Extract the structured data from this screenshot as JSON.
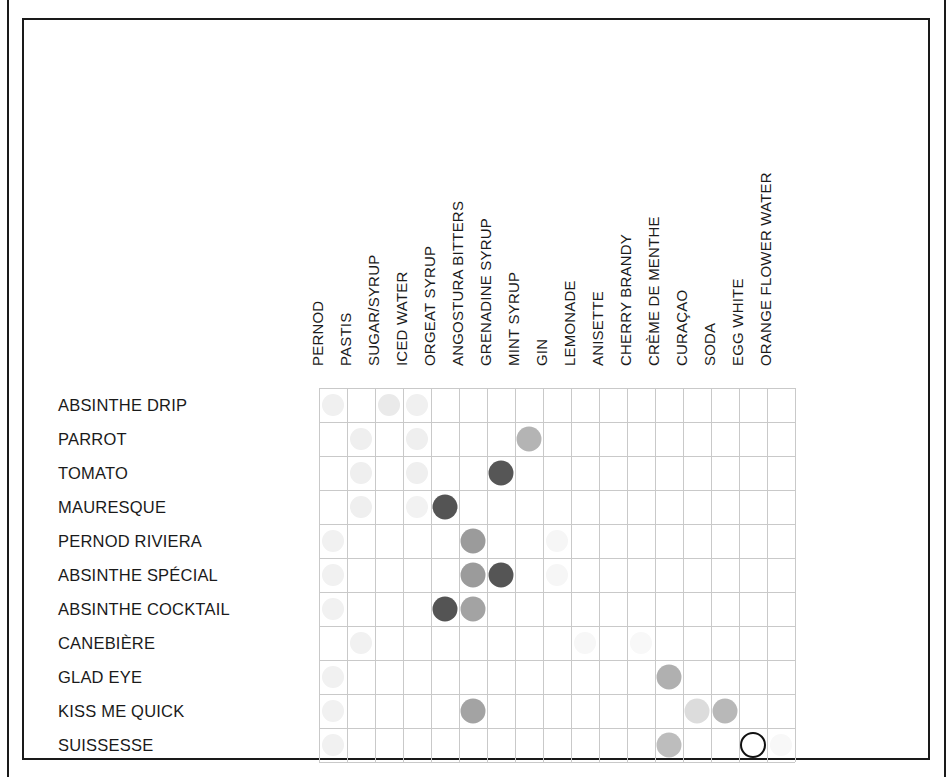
{
  "figure": {
    "title": "",
    "frame_color": "#1a1a1a",
    "grid_color": "#c9c9c9"
  },
  "chart_data": {
    "type": "heatmap",
    "title": "",
    "xlabel": "",
    "ylabel": "",
    "grid": true,
    "legend": "none",
    "categories": [
      "PERNOD",
      "PASTIS",
      "SUGAR/SYRUP",
      "ICED WATER",
      "ORGEAT SYRUP",
      "ANGOSTURA BITTERS",
      "GRENADINE SYRUP",
      "MINT SYRUP",
      "GIN",
      "LEMONADE",
      "ANISETTE",
      "CHERRY BRANDY",
      "CRÈME DE MENTHE",
      "CURAÇAO",
      "SODA",
      "EGG WHITE",
      "ORANGE FLOWER WATER"
    ],
    "rows": [
      "ABSINTHE DRIP",
      "PARROT",
      "TOMATO",
      "MAURESQUE",
      "PERNOD RIVIERA",
      "ABSINTHE SPÉCIAL",
      "ABSINTHE COCKTAIL",
      "CANEBIÈRE",
      "GLAD EYE",
      "KISS ME QUICK",
      "SUISSESSE"
    ],
    "points": [
      {
        "row": "ABSINTHE DRIP",
        "col": "PERNOD",
        "r": 0,
        "c": 0,
        "shade": "#f0f0f0",
        "size": 22,
        "style": "filled"
      },
      {
        "row": "ABSINTHE DRIP",
        "col": "SUGAR/SYRUP",
        "r": 0,
        "c": 2,
        "shade": "#eaeaea",
        "size": 22,
        "style": "filled"
      },
      {
        "row": "ABSINTHE DRIP",
        "col": "ICED WATER",
        "r": 0,
        "c": 3,
        "shade": "#f0f0f0",
        "size": 22,
        "style": "filled"
      },
      {
        "row": "PARROT",
        "col": "PASTIS",
        "r": 1,
        "c": 1,
        "shade": "#efefef",
        "size": 22,
        "style": "filled"
      },
      {
        "row": "PARROT",
        "col": "ICED WATER",
        "r": 1,
        "c": 3,
        "shade": "#efefef",
        "size": 22,
        "style": "filled"
      },
      {
        "row": "PARROT",
        "col": "MINT SYRUP",
        "r": 1,
        "c": 7,
        "shade": "#b4b4b4",
        "size": 25,
        "style": "filled"
      },
      {
        "row": "TOMATO",
        "col": "PASTIS",
        "r": 2,
        "c": 1,
        "shade": "#efefef",
        "size": 22,
        "style": "filled"
      },
      {
        "row": "TOMATO",
        "col": "ICED WATER",
        "r": 2,
        "c": 3,
        "shade": "#efefef",
        "size": 22,
        "style": "filled"
      },
      {
        "row": "TOMATO",
        "col": "GRENADINE SYRUP",
        "r": 2,
        "c": 6,
        "shade": "#565656",
        "size": 25,
        "style": "filled"
      },
      {
        "row": "MAURESQUE",
        "col": "PASTIS",
        "r": 3,
        "c": 1,
        "shade": "#efefef",
        "size": 22,
        "style": "filled"
      },
      {
        "row": "MAURESQUE",
        "col": "ICED WATER",
        "r": 3,
        "c": 3,
        "shade": "#f2f2f2",
        "size": 22,
        "style": "filled"
      },
      {
        "row": "MAURESQUE",
        "col": "ORGEAT SYRUP",
        "r": 3,
        "c": 4,
        "shade": "#545454",
        "size": 25,
        "style": "filled"
      },
      {
        "row": "PERNOD RIVIERA",
        "col": "PERNOD",
        "r": 4,
        "c": 0,
        "shade": "#f1f1f1",
        "size": 22,
        "style": "filled"
      },
      {
        "row": "PERNOD RIVIERA",
        "col": "ANGOSTURA BITTERS",
        "r": 4,
        "c": 5,
        "shade": "#9b9b9b",
        "size": 25,
        "style": "filled"
      },
      {
        "row": "PERNOD RIVIERA",
        "col": "GIN",
        "r": 4,
        "c": 8,
        "shade": "#f6f6f6",
        "size": 22,
        "style": "filled"
      },
      {
        "row": "ABSINTHE SPÉCIAL",
        "col": "PERNOD",
        "r": 5,
        "c": 0,
        "shade": "#f1f1f1",
        "size": 22,
        "style": "filled"
      },
      {
        "row": "ABSINTHE SPÉCIAL",
        "col": "ANGOSTURA BITTERS",
        "r": 5,
        "c": 5,
        "shade": "#9b9b9b",
        "size": 25,
        "style": "filled"
      },
      {
        "row": "ABSINTHE SPÉCIAL",
        "col": "GRENADINE SYRUP",
        "r": 5,
        "c": 6,
        "shade": "#555555",
        "size": 25,
        "style": "filled"
      },
      {
        "row": "ABSINTHE SPÉCIAL",
        "col": "GIN",
        "r": 5,
        "c": 8,
        "shade": "#f6f6f6",
        "size": 22,
        "style": "filled"
      },
      {
        "row": "ABSINTHE COCKTAIL",
        "col": "PERNOD",
        "r": 6,
        "c": 0,
        "shade": "#f1f1f1",
        "size": 22,
        "style": "filled"
      },
      {
        "row": "ABSINTHE COCKTAIL",
        "col": "ORGEAT SYRUP",
        "r": 6,
        "c": 4,
        "shade": "#545454",
        "size": 25,
        "style": "filled"
      },
      {
        "row": "ABSINTHE COCKTAIL",
        "col": "ANGOSTURA BITTERS",
        "r": 6,
        "c": 5,
        "shade": "#a3a3a3",
        "size": 25,
        "style": "filled"
      },
      {
        "row": "CANEBIÈRE",
        "col": "PASTIS",
        "r": 7,
        "c": 1,
        "shade": "#f1f1f1",
        "size": 22,
        "style": "filled"
      },
      {
        "row": "CANEBIÈRE",
        "col": "LEMONADE",
        "r": 7,
        "c": 9,
        "shade": "#f7f7f7",
        "size": 22,
        "style": "filled"
      },
      {
        "row": "CANEBIÈRE",
        "col": "CHERRY BRANDY",
        "r": 7,
        "c": 11,
        "shade": "#f8f8f8",
        "size": 22,
        "style": "filled"
      },
      {
        "row": "GLAD EYE",
        "col": "PERNOD",
        "r": 8,
        "c": 0,
        "shade": "#f1f1f1",
        "size": 22,
        "style": "filled"
      },
      {
        "row": "GLAD EYE",
        "col": "CRÈME DE MENTHE",
        "r": 8,
        "c": 12,
        "shade": "#b0b0b0",
        "size": 25,
        "style": "filled"
      },
      {
        "row": "KISS ME QUICK",
        "col": "PERNOD",
        "r": 9,
        "c": 0,
        "shade": "#f1f1f1",
        "size": 22,
        "style": "filled"
      },
      {
        "row": "KISS ME QUICK",
        "col": "ANGOSTURA BITTERS",
        "r": 9,
        "c": 5,
        "shade": "#a3a3a3",
        "size": 25,
        "style": "filled"
      },
      {
        "row": "KISS ME QUICK",
        "col": "CURAÇAO",
        "r": 9,
        "c": 13,
        "shade": "#dcdcdc",
        "size": 25,
        "style": "filled"
      },
      {
        "row": "KISS ME QUICK",
        "col": "SODA",
        "r": 9,
        "c": 14,
        "shade": "#b8b8b8",
        "size": 25,
        "style": "filled"
      },
      {
        "row": "SUISSESSE",
        "col": "PERNOD",
        "r": 10,
        "c": 0,
        "shade": "#f1f1f1",
        "size": 22,
        "style": "filled"
      },
      {
        "row": "SUISSESSE",
        "col": "CRÈME DE MENTHE",
        "r": 10,
        "c": 12,
        "shade": "#bdbdbd",
        "size": 25,
        "style": "filled"
      },
      {
        "row": "SUISSESSE",
        "col": "EGG WHITE",
        "r": 10,
        "c": 15,
        "shade": "#ffffff",
        "size": 26,
        "style": "hollow"
      },
      {
        "row": "SUISSESSE",
        "col": "ORANGE FLOWER WATER",
        "r": 10,
        "c": 16,
        "shade": "#f8f8f8",
        "size": 22,
        "style": "filled"
      }
    ]
  },
  "geometry": {
    "grid_left": 319,
    "grid_top": 388,
    "col_step": 28,
    "row_step": 34,
    "n_cols": 17,
    "n_rows": 11,
    "col_label_baseline": 366,
    "row_label_left": 58
  }
}
